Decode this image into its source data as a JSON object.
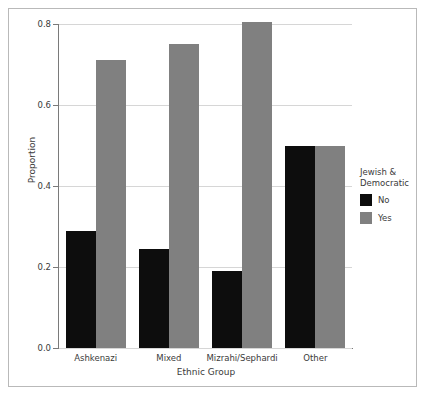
{
  "chart_data": {
    "type": "bar",
    "title": "",
    "subtitle": "",
    "xlabel": "Ethnic Group",
    "ylabel": "Proportion",
    "categories": [
      "Ashkenazi",
      "Mixed",
      "Mizrahi/Sephardi",
      "Other"
    ],
    "series": [
      {
        "name": "No",
        "color": "#0d0d0d",
        "values": [
          0.288,
          0.245,
          0.19,
          0.5
        ]
      },
      {
        "name": "Yes",
        "color": "#808080",
        "values": [
          0.71,
          0.75,
          0.805,
          0.5
        ]
      }
    ],
    "ylim": [
      0.0,
      0.8
    ],
    "yticks": [
      "0.0",
      "0.2",
      "0.4",
      "0.6",
      "0.8"
    ],
    "ytick_values": [
      0.0,
      0.2,
      0.4,
      0.6,
      0.8
    ],
    "grid": true,
    "grid_axis": "y",
    "legend": {
      "title": "Jewish &\nDemocratic",
      "position": "right",
      "entries": [
        {
          "label": "No",
          "color": "#0d0d0d"
        },
        {
          "label": "Yes",
          "color": "#808080"
        }
      ]
    },
    "frame_color": "#b9b9b9",
    "axis_color": "#7a7a7a",
    "gridline_color": "#d6d6d6"
  }
}
